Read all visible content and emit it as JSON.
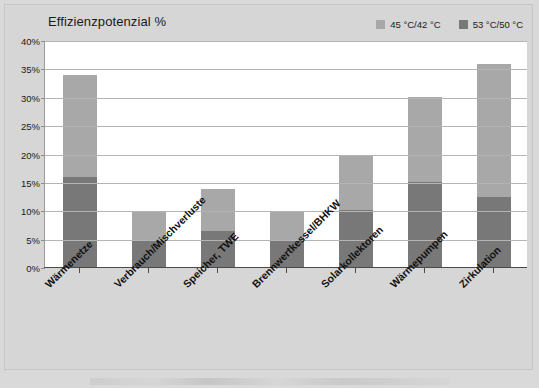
{
  "chart_data": {
    "type": "bar",
    "title": "Effizienzpotenzial %",
    "xlabel": "",
    "ylabel": "",
    "ylim": [
      0,
      40
    ],
    "ytick_labels": [
      "0%",
      "5%",
      "10%",
      "15%",
      "20%",
      "25%",
      "30%",
      "35%",
      "40%"
    ],
    "ytick_values": [
      0,
      5,
      10,
      15,
      20,
      25,
      30,
      35,
      40
    ],
    "grid": true,
    "stacked": true,
    "legend_position": "top-right",
    "categories": [
      "Wärmenetze",
      "Verbrauch/Mischverluste",
      "Speicher, TWE",
      "Brennwertkessel/BHKW",
      "Solarkollektoren",
      "Wärmepumpen",
      "Zirkulation"
    ],
    "series": [
      {
        "name": "53 °C/50 °C",
        "color": "#787878",
        "values": [
          16.0,
          5.0,
          6.5,
          5.0,
          10.2,
          15.2,
          12.5
        ]
      },
      {
        "name": "45 °C/42 °C",
        "color": "#a8a8a8",
        "values": [
          18.0,
          5.0,
          7.5,
          5.0,
          9.8,
          15.0,
          23.5
        ]
      }
    ],
    "totals": [
      34.0,
      10.0,
      14.0,
      10.0,
      20.0,
      30.2,
      36.0
    ]
  },
  "legend": {
    "items": [
      {
        "label": "45 °C/42 °C",
        "color": "#a8a8a8"
      },
      {
        "label": "53 °C/50 °C",
        "color": "#787878"
      }
    ]
  },
  "colors": {
    "light_gray_series": "#a8a8a8",
    "dark_gray_series": "#787878",
    "background": "#d6d6d6",
    "plot_background": "#ffffff",
    "gridline": "#b4b4b4",
    "axis": "#4a4a4a",
    "text": "#1a1a1a"
  }
}
